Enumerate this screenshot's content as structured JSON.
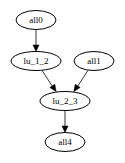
{
  "graph": {
    "nodes": [
      {
        "id": "all0",
        "label": "all0",
        "cx": 36,
        "cy": 20,
        "rx": 20,
        "ry": 9.5
      },
      {
        "id": "lu_1_2",
        "label": "lu_1_2",
        "cx": 36,
        "cy": 61,
        "rx": 25,
        "ry": 9.5
      },
      {
        "id": "all1",
        "label": "all1",
        "cx": 94,
        "cy": 61,
        "rx": 20,
        "ry": 9.5
      },
      {
        "id": "lu_2_3",
        "label": "lu_2_3",
        "cx": 65,
        "cy": 101,
        "rx": 25,
        "ry": 9.5
      },
      {
        "id": "all4",
        "label": "all4",
        "cx": 65,
        "cy": 142,
        "rx": 20,
        "ry": 9.5
      }
    ],
    "edges": [
      {
        "from": "all0",
        "to": "lu_1_2"
      },
      {
        "from": "lu_1_2",
        "to": "lu_2_3"
      },
      {
        "from": "all1",
        "to": "lu_2_3"
      },
      {
        "from": "lu_2_3",
        "to": "all4"
      }
    ]
  }
}
